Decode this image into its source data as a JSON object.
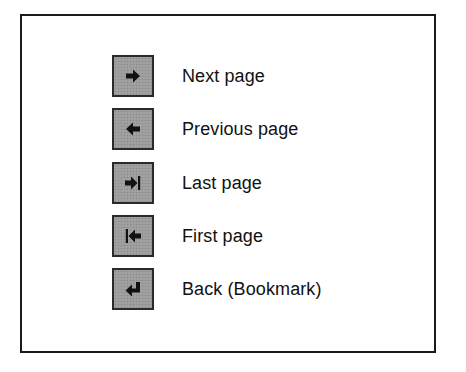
{
  "legend": {
    "items": [
      {
        "icon": "arrow-right-icon",
        "label": "Next page"
      },
      {
        "icon": "arrow-left-icon",
        "label": "Previous page"
      },
      {
        "icon": "arrow-right-bar-icon",
        "label": "Last page"
      },
      {
        "icon": "arrow-left-bar-icon",
        "label": "First page"
      },
      {
        "icon": "return-arrow-icon",
        "label": "Back (Bookmark)"
      }
    ]
  },
  "colors": {
    "button_fill": "#9c9c9c",
    "button_border": "#2a2a2a",
    "frame_border": "#1a1a1a",
    "text": "#111111"
  }
}
